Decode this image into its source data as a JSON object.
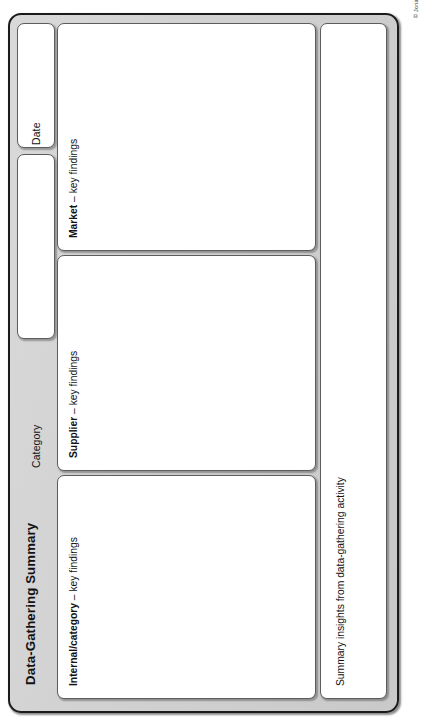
{
  "document": {
    "title": "Data-Gathering Summary",
    "copyright": "© Jonathan O'Brien, 2015",
    "orientation": "landscape-rotated-90ccw"
  },
  "fields": [
    {
      "key": "date",
      "label": "Date",
      "value": ""
    },
    {
      "key": "category",
      "label": "Category",
      "value": ""
    }
  ],
  "panels": [
    {
      "key": "market",
      "label_strong": "Market",
      "label_rest": " – key findings",
      "value": ""
    },
    {
      "key": "supplier",
      "label_strong": "Supplier",
      "label_rest": " – key findings",
      "value": ""
    },
    {
      "key": "internal",
      "label_strong": "Internal/category",
      "label_rest": " – key findings",
      "value": ""
    }
  ],
  "summary": {
    "key": "summary-insights",
    "label": "Summary insights from data-gathering activity",
    "value": ""
  },
  "colors": {
    "frame_fill": "#d2d2d2",
    "frame_border": "#1b1b1b",
    "card_fill": "#ffffff",
    "card_border": "#5d5d5d",
    "text": "#121212",
    "page_background": "#ffffff"
  }
}
